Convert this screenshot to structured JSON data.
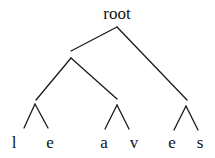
{
  "tree": {
    "root": {
      "label": "root",
      "x": 117,
      "y": 5
    },
    "leaves": [
      {
        "label": "l",
        "x": 14,
        "y": 134
      },
      {
        "label": "e",
        "x": 50,
        "y": 134
      },
      {
        "label": "a",
        "x": 104,
        "y": 134
      },
      {
        "label": "v",
        "x": 134,
        "y": 134
      },
      {
        "label": "e",
        "x": 172,
        "y": 134
      },
      {
        "label": "s",
        "x": 200,
        "y": 134
      }
    ],
    "edges": [
      {
        "name": "root-to-left-subtree",
        "x1": 117,
        "y1": 27,
        "x2": 71,
        "y2": 51
      },
      {
        "name": "root-to-right-subtree",
        "x1": 117,
        "y1": 27,
        "x2": 187,
        "y2": 100
      },
      {
        "name": "left-node-to-le",
        "x1": 71,
        "y1": 58,
        "x2": 36,
        "y2": 100
      },
      {
        "name": "left-node-to-av",
        "x1": 71,
        "y1": 58,
        "x2": 117,
        "y2": 99
      },
      {
        "name": "le-left-leg",
        "x1": 35,
        "y1": 104,
        "x2": 24,
        "y2": 128
      },
      {
        "name": "le-right-leg",
        "x1": 35,
        "y1": 104,
        "x2": 48,
        "y2": 128
      },
      {
        "name": "av-left-leg",
        "x1": 117,
        "y1": 105,
        "x2": 105,
        "y2": 129
      },
      {
        "name": "av-right-leg",
        "x1": 117,
        "y1": 105,
        "x2": 129,
        "y2": 129
      },
      {
        "name": "es-left-leg",
        "x1": 186,
        "y1": 106,
        "x2": 174,
        "y2": 130
      },
      {
        "name": "es-right-leg",
        "x1": 186,
        "y1": 106,
        "x2": 198,
        "y2": 130
      }
    ]
  }
}
